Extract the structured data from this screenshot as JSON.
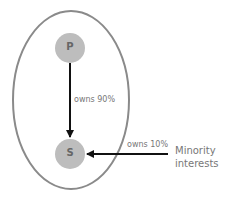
{
  "diagram": {
    "group_boundary": {
      "shape": "ellipse",
      "color": "#8a8a8a"
    },
    "nodes": [
      {
        "id": "P",
        "label": "P",
        "color": "#bdbdbd"
      },
      {
        "id": "S",
        "label": "S",
        "color": "#bdbdbd"
      }
    ],
    "edges": [
      {
        "from": "P",
        "to": "S",
        "label": "owns 90%"
      },
      {
        "from": "Minority interests",
        "to": "S",
        "label": "owns 10%"
      }
    ],
    "external_label": {
      "line1": "Minority",
      "line2": "interests"
    }
  }
}
